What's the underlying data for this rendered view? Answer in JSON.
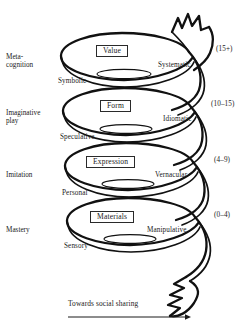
{
  "figure": {
    "type": "spiral-developmental-diagram",
    "line_color": "#111111",
    "text_color": "#1a1a1a",
    "background": "#ffffff"
  },
  "stages": [
    {
      "stage_label": "Meta-\ncognition",
      "boxed_label": "Value",
      "inner_label": "Symbolic",
      "right_label": "Systematic",
      "age_label": "(15+)"
    },
    {
      "stage_label": "Imaginative\nplay",
      "boxed_label": "Form",
      "inner_label": "Speculative",
      "right_label": "Idiomatic",
      "age_label": "(10–15)"
    },
    {
      "stage_label": "Imitation",
      "boxed_label": "Expression",
      "inner_label": "Personal",
      "right_label": "Vernacular",
      "age_label": "(4–9)"
    },
    {
      "stage_label": "Mastery",
      "boxed_label": "Materials",
      "inner_label": "Sensory",
      "right_label": "Manipulative",
      "age_label": "(0–4)"
    }
  ],
  "caption": {
    "text": "Towards social sharing",
    "direction_icon": "arrow-right-icon"
  }
}
